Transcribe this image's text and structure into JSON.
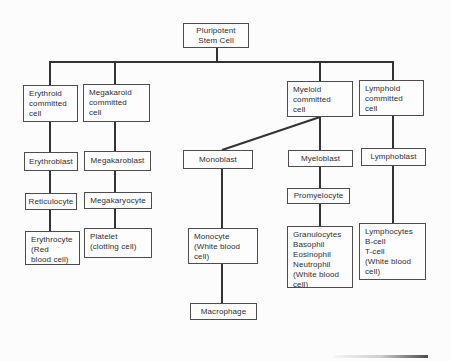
{
  "diagram": {
    "boxes": {
      "pluripotent_stem_cell": "Pluripotent\nStem Cell",
      "erythroid_committed": "Erythroid\ncommitted\ncell",
      "megakaroid_committed": "Megakaroid\ncommitted\ncell",
      "myeloid_committed": "Myeloid\ncommitted\ncell",
      "lymphoid_committed": "Lymphoid\ncommitted\ncell",
      "erythroblast": "Erythroblast",
      "megakaroblast": "Megakaroblast",
      "monoblast": "Monoblast",
      "myeloblast": "Myeloblast",
      "lymphoblast": "Lymphoblast",
      "reticulocyte": "Reticulocyte",
      "megakaryocyte": "Megakaryocyte",
      "promyelocyte": "Promyelocyte",
      "erythrocyte": "Erythrocyte\n(Red\nblood cell)",
      "platelet": "Platelet\n(clotting cell)",
      "monocyte": "Monocyte\n(White blood\ncell)",
      "granulocytes": "Granulocytes\nBasophil\nEosinophil\nNeutrophil\n(White blood\ncell)",
      "lymphocytes": "Lymphocytes\nB-cell\nT-cell\n(White blood\ncell)",
      "macrophage": "Macrophage"
    },
    "colors": {
      "line": "#333333",
      "box_border": "#4d4d4d",
      "text": "#2f2f2f",
      "background": "#fcfcfc"
    }
  }
}
